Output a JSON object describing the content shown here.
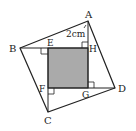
{
  "diagram": {
    "points": {
      "A": {
        "label": "A",
        "x": 88,
        "y": 21
      },
      "B": {
        "label": "B",
        "x": 20,
        "y": 48
      },
      "C": {
        "label": "C",
        "x": 48,
        "y": 112
      },
      "D": {
        "label": "D",
        "x": 115,
        "y": 88
      },
      "E": {
        "label": "E",
        "x": 48,
        "y": 48
      },
      "F": {
        "label": "F",
        "x": 48,
        "y": 88
      },
      "G": {
        "label": "G",
        "x": 88,
        "y": 88
      },
      "H": {
        "label": "H",
        "x": 88,
        "y": 48
      }
    },
    "measure": {
      "text": "2cm",
      "segment": "AH"
    },
    "colors": {
      "stroke": "#222222",
      "fill": "#aaaaaa",
      "background": "#ffffff"
    }
  }
}
